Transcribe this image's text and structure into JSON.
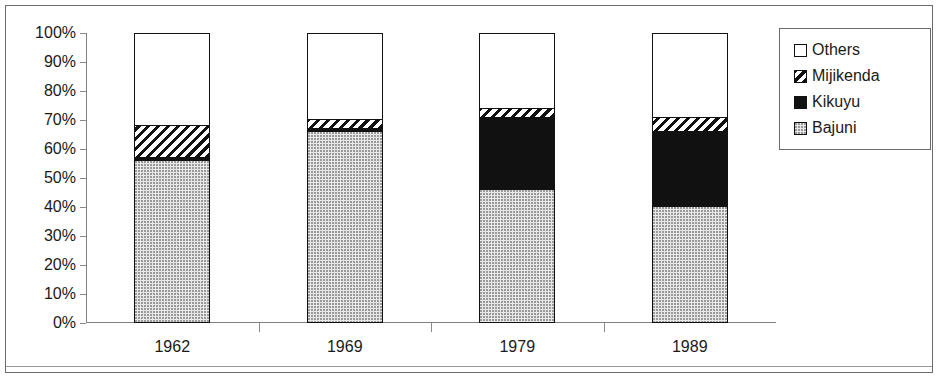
{
  "chart_data": {
    "type": "bar",
    "subtype": "stacked-100-percent",
    "title": "",
    "xlabel": "",
    "ylabel": "",
    "categories": [
      "1962",
      "1969",
      "1979",
      "1989"
    ],
    "ylim": [
      0,
      100
    ],
    "ytick_labels": [
      "0%",
      "10%",
      "20%",
      "30%",
      "40%",
      "50%",
      "60%",
      "70%",
      "80%",
      "90%",
      "100%"
    ],
    "ytick_values": [
      0,
      10,
      20,
      30,
      40,
      50,
      60,
      70,
      80,
      90,
      100
    ],
    "grid": false,
    "legend_position": "right",
    "stack_order_bottom_to_top": [
      "Bajuni",
      "Kikuyu",
      "Mijikenda",
      "Others"
    ],
    "series": [
      {
        "name": "Bajuni",
        "pattern": "dotted",
        "values": [
          56,
          66,
          46,
          40
        ]
      },
      {
        "name": "Kikuyu",
        "pattern": "solid",
        "values": [
          1,
          1,
          25,
          26
        ]
      },
      {
        "name": "Mijikenda",
        "pattern": "hatched",
        "values": [
          11,
          3,
          3,
          5
        ]
      },
      {
        "name": "Others",
        "pattern": "empty",
        "values": [
          32,
          30,
          26,
          29
        ]
      }
    ]
  },
  "legend": {
    "items": [
      {
        "label": "Others",
        "pattern": "empty"
      },
      {
        "label": "Mijikenda",
        "pattern": "hatched"
      },
      {
        "label": "Kikuyu",
        "pattern": "solid"
      },
      {
        "label": "Bajuni",
        "pattern": "dotted"
      }
    ]
  }
}
